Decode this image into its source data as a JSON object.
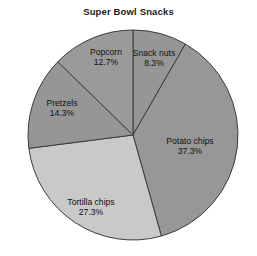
{
  "chart_data": {
    "type": "pie",
    "title": "Super Bowl Snacks",
    "xlabel": "",
    "ylabel": "",
    "categories": [
      "Snack nuts",
      "Potato chips",
      "Tortilla chips",
      "Pretzels",
      "Popcorn"
    ],
    "values": [
      8.3,
      37.3,
      27.3,
      14.3,
      12.7
    ],
    "value_suffix": "%",
    "start_angle_deg": 0,
    "direction": "clockwise",
    "legend": "none",
    "grid": false,
    "slices": [
      {
        "label": "Snack nuts",
        "value": 8.3,
        "value_text": "8.3%",
        "color": "#969696",
        "label_x": 154,
        "label_y": 54,
        "pct_x": 154,
        "pct_y": 64
      },
      {
        "label": "Potato chips",
        "value": 37.3,
        "value_text": "37.3%",
        "color": "#979797",
        "label_x": 190,
        "label_y": 142,
        "pct_x": 190,
        "pct_y": 152
      },
      {
        "label": "Tortilla chips",
        "value": 27.3,
        "value_text": "27.3%",
        "color": "#c9c9c9",
        "label_x": 91,
        "label_y": 203,
        "pct_x": 91,
        "pct_y": 213
      },
      {
        "label": "Pretzels",
        "value": 14.3,
        "value_text": "14.3%",
        "color": "#969696",
        "label_x": 62,
        "label_y": 104,
        "pct_x": 62,
        "pct_y": 114
      },
      {
        "label": "Popcorn",
        "value": 12.7,
        "value_text": "12.7%",
        "color": "#9a9a9a",
        "label_x": 106,
        "label_y": 53,
        "pct_x": 106,
        "pct_y": 63
      }
    ],
    "geometry": {
      "center_x": 133,
      "center_y": 135,
      "radius": 105
    },
    "style": {
      "stroke_color": "#3c3c3c",
      "stroke_width": 1,
      "background": "#ffffff",
      "title_color": "#1a1a1a",
      "label_color": "#111111"
    }
  }
}
